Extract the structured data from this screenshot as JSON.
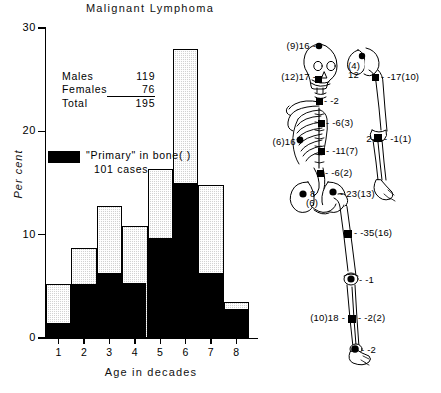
{
  "title": "Malignant Lymphoma",
  "chart_data": {
    "type": "bar",
    "title": "Malignant Lymphoma",
    "xlabel": "Age in decades",
    "ylabel": "Per cent",
    "categories": [
      "1",
      "2",
      "3",
      "4",
      "5",
      "6",
      "7",
      "8"
    ],
    "xlim": [
      0.5,
      8.5
    ],
    "ylim": [
      0,
      30
    ],
    "yticks": [
      0,
      10,
      20,
      30
    ],
    "grid": false,
    "legend_position": "inside-upper-left",
    "stacked": true,
    "series": [
      {
        "name": "\"Primary\" in bone( )",
        "fill": "black",
        "values": [
          1.5,
          5.2,
          6.3,
          5.3,
          9.7,
          15.0,
          6.3,
          2.8
        ]
      },
      {
        "name": "All cases (total)",
        "fill": "stippled-grey",
        "values": [
          5.2,
          8.7,
          12.8,
          10.8,
          16.4,
          28.0,
          14.8,
          3.5
        ]
      }
    ],
    "annotations": [
      "Males 119",
      "Females 76",
      "Total 195",
      "\"Primary\" in bone( ) 101 cases"
    ]
  },
  "stats": {
    "rows": [
      {
        "label": "Males",
        "value": "119",
        "ruled": false
      },
      {
        "label": "Females",
        "value": "76",
        "ruled": true
      },
      {
        "label": "Total",
        "value": "195",
        "ruled": false
      }
    ]
  },
  "legend": {
    "primary_text": "\"Primary\" in bone( )",
    "cases_text": "101 cases"
  },
  "axes": {
    "y_ticks": [
      "30",
      "20",
      "10",
      "0"
    ],
    "x_ticks": [
      "1",
      "2",
      "3",
      "4",
      "5",
      "6",
      "7",
      "8"
    ],
    "y_title": "Per cent",
    "x_title": "Age in decades"
  },
  "skeleton": {
    "caption": "Skeletal distribution of lesions",
    "labels": [
      {
        "id": "skull-top",
        "text": "(9)16 -",
        "side": "left"
      },
      {
        "id": "skull-jaw",
        "text": "(12)17 -",
        "side": "left"
      },
      {
        "id": "scapula",
        "text": "(4)",
        "side": "right"
      },
      {
        "id": "scapula-second",
        "text": "12",
        "side": "right"
      },
      {
        "id": "humerus-proximal",
        "text": "- -17(10)",
        "side": "right"
      },
      {
        "id": "cervical-spine",
        "text": "- -2",
        "side": "right"
      },
      {
        "id": "thoracic-spine",
        "text": "- -6(3)",
        "side": "right"
      },
      {
        "id": "ribs-left",
        "text": "(6)16 -",
        "side": "left"
      },
      {
        "id": "lumbar-spine",
        "text": "- -11(7)",
        "side": "right"
      },
      {
        "id": "elbow-left",
        "text": "2-",
        "side": "left"
      },
      {
        "id": "radius-ulna",
        "text": "- -1(1)",
        "side": "right"
      },
      {
        "id": "sacrum",
        "text": "- -6(2)",
        "side": "right"
      },
      {
        "id": "ilium-left",
        "text": "8",
        "side": "right"
      },
      {
        "id": "ilium-left-paren",
        "text": "(6)",
        "side": "right"
      },
      {
        "id": "femur-head",
        "text": "- 23(13)",
        "side": "right"
      },
      {
        "id": "femur-shaft",
        "text": "- -35(16)",
        "side": "right"
      },
      {
        "id": "knee",
        "text": "- -1",
        "side": "right"
      },
      {
        "id": "tibia-left",
        "text": "(10)18 -",
        "side": "left"
      },
      {
        "id": "tibia-right",
        "text": "- -2(2)",
        "side": "right"
      },
      {
        "id": "foot",
        "text": "- -2",
        "side": "right"
      }
    ]
  }
}
